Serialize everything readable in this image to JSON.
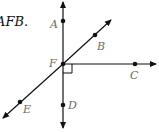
{
  "caption": "AFB.",
  "points": {
    "A": {
      "label": "A"
    },
    "B": {
      "label": "B"
    },
    "C": {
      "label": "C"
    },
    "D": {
      "label": "D"
    },
    "E": {
      "label": "E"
    },
    "F": {
      "label": "F"
    }
  },
  "colors": {
    "line": "#111111",
    "label": "#6a6a6a"
  }
}
